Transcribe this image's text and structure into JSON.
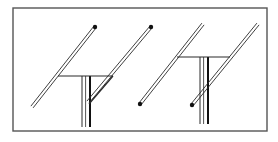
{
  "diagram": {
    "type": "line-drawing",
    "colors": {
      "stroke": "#2a2a2a",
      "background": "#ffffff"
    },
    "frame": {
      "x": 13,
      "y": 8,
      "width": 254,
      "height": 123
    },
    "figures": [
      {
        "name": "left-configuration",
        "rods": [
          {
            "x1": 32,
            "y1": 107,
            "x2": 95,
            "y2": 27,
            "dot": "end"
          },
          {
            "x1": 88,
            "y1": 102,
            "x2": 151,
            "y2": 27,
            "dot": "end"
          }
        ],
        "crossbar": {
          "x1": 58,
          "y1": 76,
          "x2": 113,
          "y2": 76
        },
        "mast": {
          "x": 82,
          "width": 8,
          "y1": 76,
          "y2": 127
        },
        "brace": {
          "x1": 89,
          "y1": 104,
          "x2": 113,
          "y2": 76
        }
      },
      {
        "name": "right-configuration",
        "rods": [
          {
            "x1": 140,
            "y1": 104,
            "x2": 203,
            "y2": 24,
            "dot": "start"
          },
          {
            "x1": 192,
            "y1": 105,
            "x2": 258,
            "y2": 24,
            "dot": "start"
          }
        ],
        "crossbar": {
          "x1": 177,
          "y1": 57,
          "x2": 230,
          "y2": 57
        },
        "mast": {
          "x": 200,
          "width": 8,
          "y1": 57,
          "y2": 124
        }
      }
    ]
  }
}
